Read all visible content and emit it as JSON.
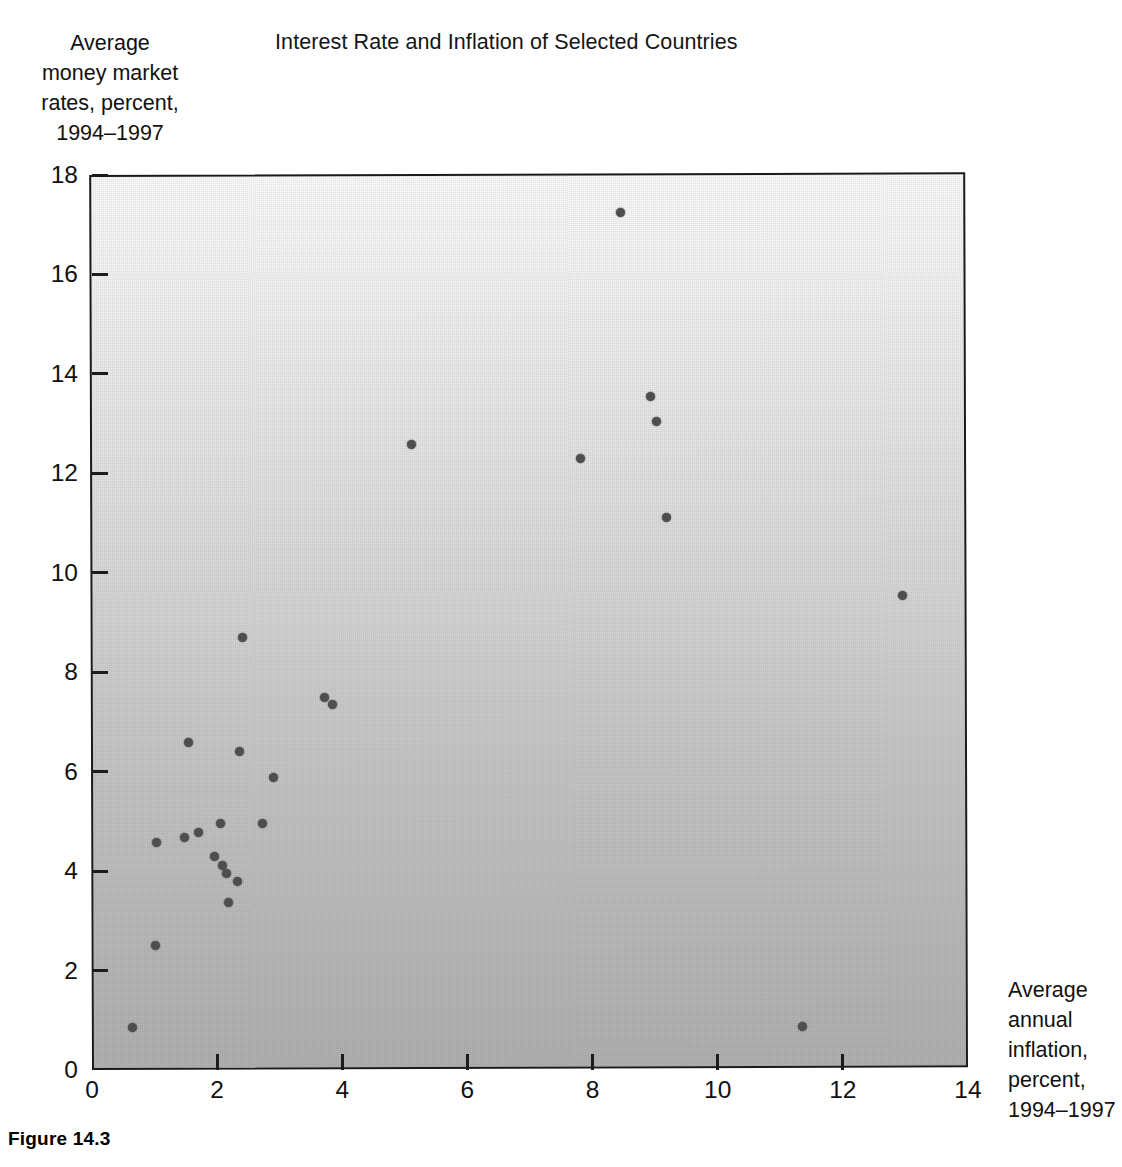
{
  "figure": {
    "caption": "Figure 14.3"
  },
  "chart_data": {
    "type": "scatter",
    "title": "Interest Rate and Inflation of Selected Countries",
    "xlabel": "Average annual inflation, percent, 1994–1997",
    "ylabel": "Average money market rates, percent, 1994–1997",
    "xlabel_lines": [
      "Average",
      "annual",
      "inflation,",
      "percent,",
      "1994–1997"
    ],
    "ylabel_lines": [
      "Average",
      "money market",
      "rates, percent,",
      "1994–1997"
    ],
    "xlim": [
      0,
      14
    ],
    "ylim": [
      0,
      18
    ],
    "xticks": [
      0,
      2,
      4,
      6,
      8,
      10,
      12,
      14
    ],
    "xtick_labels": [
      "0",
      "2",
      "4",
      "6",
      "8",
      "10",
      "12",
      "14"
    ],
    "yticks": [
      0,
      2,
      4,
      6,
      8,
      10,
      12,
      14,
      16,
      18
    ],
    "ytick_labels": [
      "0",
      "2",
      "4",
      "6",
      "8",
      "10",
      "12",
      "14",
      "16",
      "18"
    ],
    "grid": false,
    "legend": null,
    "marker_color": "#4e4e4e",
    "plot_background": "linear-gradient light-grey (top) to mid-grey (bottom)",
    "points": [
      {
        "x": 0.65,
        "y": 0.85
      },
      {
        "x": 1.02,
        "y": 2.5
      },
      {
        "x": 1.03,
        "y": 4.57
      },
      {
        "x": 1.48,
        "y": 4.68
      },
      {
        "x": 1.55,
        "y": 6.58
      },
      {
        "x": 1.7,
        "y": 4.78
      },
      {
        "x": 1.95,
        "y": 4.3
      },
      {
        "x": 2.05,
        "y": 4.95
      },
      {
        "x": 2.08,
        "y": 4.12
      },
      {
        "x": 2.15,
        "y": 3.95
      },
      {
        "x": 2.18,
        "y": 3.37
      },
      {
        "x": 2.32,
        "y": 3.8
      },
      {
        "x": 2.35,
        "y": 6.4
      },
      {
        "x": 2.4,
        "y": 8.7
      },
      {
        "x": 2.72,
        "y": 4.95
      },
      {
        "x": 2.9,
        "y": 5.88
      },
      {
        "x": 3.72,
        "y": 7.5
      },
      {
        "x": 3.85,
        "y": 7.35
      },
      {
        "x": 5.1,
        "y": 12.58
      },
      {
        "x": 7.8,
        "y": 12.3
      },
      {
        "x": 8.44,
        "y": 17.25
      },
      {
        "x": 8.92,
        "y": 13.55
      },
      {
        "x": 9.02,
        "y": 13.05
      },
      {
        "x": 9.18,
        "y": 11.12
      },
      {
        "x": 11.35,
        "y": 0.88
      },
      {
        "x": 12.96,
        "y": 9.55
      }
    ]
  }
}
